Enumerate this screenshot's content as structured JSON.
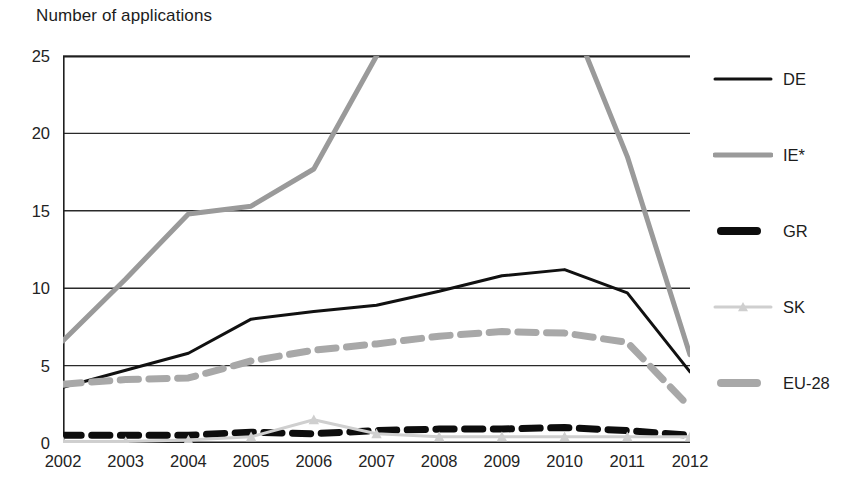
{
  "chart_data": {
    "type": "line",
    "title": "",
    "ylabel": "Number of applications",
    "xlabel": "",
    "ylim": [
      0,
      25
    ],
    "yticks": [
      0,
      5,
      10,
      15,
      20,
      25
    ],
    "grid": true,
    "legend_position": "right",
    "clipped_note": "IE* exceeds the 25 axis maximum between 2007 and 2010",
    "categories": [
      "2002",
      "2003",
      "2004",
      "2005",
      "2006",
      "2007",
      "2008",
      "2009",
      "2010",
      "2011",
      "2012"
    ],
    "series": [
      {
        "name": "DE",
        "color": "#111111",
        "style": "solid",
        "width": 3,
        "values": [
          3.6,
          4.7,
          5.8,
          8.0,
          8.5,
          8.9,
          9.8,
          10.8,
          11.2,
          9.7,
          4.6
        ]
      },
      {
        "name": "IE*",
        "color": "#9a9a9a",
        "style": "solid",
        "width": 5,
        "values": [
          6.6,
          10.6,
          14.8,
          15.3,
          17.7,
          25.0,
          31.0,
          33.0,
          28.5,
          18.5,
          5.7
        ]
      },
      {
        "name": "GR",
        "color": "#0d0d0d",
        "style": "dashed",
        "width": 7,
        "values": [
          0.5,
          0.5,
          0.5,
          0.7,
          0.6,
          0.8,
          0.9,
          0.9,
          1.0,
          0.8,
          0.5
        ]
      },
      {
        "name": "SK",
        "color": "#cfcfcf",
        "style": "solid-marker",
        "width": 3,
        "values": [
          0.1,
          0.1,
          0.2,
          0.4,
          1.5,
          0.6,
          0.4,
          0.4,
          0.4,
          0.4,
          0.4
        ]
      },
      {
        "name": "EU-28",
        "color": "#a8a8a8",
        "style": "dashed",
        "width": 7,
        "values": [
          3.8,
          4.1,
          4.2,
          5.3,
          6.0,
          6.4,
          6.9,
          7.2,
          7.1,
          6.5,
          2.3
        ]
      }
    ]
  },
  "legend": {
    "items": [
      {
        "label": "DE",
        "swatch": "solid-thin-black"
      },
      {
        "label": "IE*",
        "swatch": "solid-thin-gray"
      },
      {
        "label": "GR",
        "swatch": "thick-black-dash"
      },
      {
        "label": "SK",
        "swatch": "thin-lightgray-marker"
      },
      {
        "label": "EU-28",
        "swatch": "thick-gray-dash"
      }
    ]
  },
  "colors": {
    "de": "#111111",
    "ie": "#9a9a9a",
    "gr": "#0d0d0d",
    "sk": "#cfcfcf",
    "eu28": "#a8a8a8",
    "axis": "#1f1f1f",
    "grid": "#2a2a2a",
    "background": "#ffffff"
  }
}
